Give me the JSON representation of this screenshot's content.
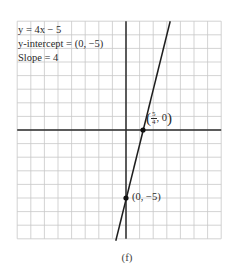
{
  "chart_data": {
    "type": "line",
    "title": "",
    "equation": "y = 4x − 5",
    "annotations": [
      {
        "text": "y = 4x − 5"
      },
      {
        "text": "y-intercept = (0, −5)"
      },
      {
        "text": "Slope = 4"
      }
    ],
    "series": [
      {
        "name": "y = 4x − 5",
        "slope": 4,
        "intercept": -5,
        "x": [
          -0.75,
          3.25
        ],
        "y": [
          -8,
          8
        ]
      }
    ],
    "points": [
      {
        "x": 1.25,
        "y": 0,
        "label": "(5/4, 0)"
      },
      {
        "x": 0,
        "y": -5,
        "label": "(0, −5)"
      }
    ],
    "xlim": [
      -8,
      7
    ],
    "ylim": [
      -8,
      8
    ],
    "grid": true,
    "xlabel": "",
    "ylabel": "",
    "caption": "(f)"
  },
  "info": {
    "line1": "y = 4x − 5",
    "line2": "y-intercept = (0, −5)",
    "line3": "Slope = 4"
  },
  "labels": {
    "x_intercept_num": "5",
    "x_intercept_den": "4",
    "x_intercept_rest": ", 0",
    "y_intercept": "(0,  −5)"
  },
  "caption": "(f)",
  "colors": {
    "grid": "#c8c8c8",
    "axis": "#2b2b2b",
    "line": "#1e1e1e",
    "point": "#111111"
  }
}
